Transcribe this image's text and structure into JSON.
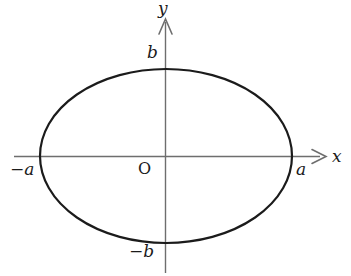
{
  "figure": {
    "kind": "ellipse-diagram",
    "background_color": "#ffffff",
    "axis_color": "#6e6e6e",
    "curve_color": "#1b1b1b",
    "axes": {
      "x_label": "x",
      "y_label": "y",
      "origin_label": "O",
      "x_line": {
        "x1": 14,
        "x2": 318,
        "y": 156
      },
      "y_line": {
        "y1": 22,
        "y2": 272,
        "x": 166
      },
      "x_arrow_tip": {
        "x": 326,
        "y": 156
      },
      "y_arrow_tip": {
        "x": 166,
        "y": 19
      }
    },
    "ellipse": {
      "center": {
        "x": 166,
        "y": 156
      },
      "semi_axis_x_px": 126,
      "semi_axis_y_px": 87,
      "stroke_width": 2.2
    },
    "vertex_labels": {
      "right": "a",
      "left": "−a",
      "top": "b",
      "bottom": "−b"
    }
  }
}
